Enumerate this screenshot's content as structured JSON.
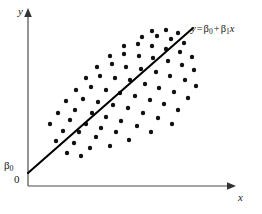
{
  "figure": {
    "kind": "scatter-with-regression-line",
    "background_color": "#ffffff",
    "axis_color": "#4d4d4d",
    "line_color": "#000000",
    "point_color": "#111111"
  },
  "labels": {
    "y_axis": "y",
    "x_axis": "x",
    "origin": "0",
    "intercept_symbol": "β",
    "intercept_subscript": "0",
    "equation": {
      "lhs": "y",
      "equals": "=",
      "beta0_symbol": "β",
      "beta0_sub": "0",
      "plus": "+",
      "beta1_symbol": "β",
      "beta1_sub": "1",
      "x_var": "x",
      "full_text": "y = β0 + β1x"
    }
  },
  "chart_data": {
    "type": "scatter",
    "title": "",
    "xlabel": "x",
    "ylabel": "y",
    "grid": false,
    "legend": null,
    "axis_ranges": {
      "x_pixel": [
        28,
        236
      ],
      "y_pixel": [
        10,
        186
      ]
    },
    "annotations": [
      {
        "name": "equation-label",
        "text": "y = β0 + β1x",
        "x": 191,
        "y": 29
      },
      {
        "name": "intercept-label",
        "text": "β0",
        "x": 10,
        "y": 166
      },
      {
        "name": "origin-label",
        "text": "0",
        "x": 17,
        "y": 180
      }
    ],
    "regression_line": {
      "name": "y = β0 + β1x",
      "x_start": 28,
      "y_start": 173,
      "x_end": 193,
      "y_end": 28,
      "intercept_label": "β0"
    },
    "point_radius": 2.2,
    "points": [
      [
        67,
        153
      ],
      [
        81,
        156
      ],
      [
        56,
        141
      ],
      [
        74,
        143
      ],
      [
        90,
        148
      ],
      [
        63,
        131
      ],
      [
        79,
        132
      ],
      [
        96,
        137
      ],
      [
        110,
        146
      ],
      [
        50,
        124
      ],
      [
        70,
        120
      ],
      [
        86,
        124
      ],
      [
        101,
        128
      ],
      [
        116,
        132
      ],
      [
        129,
        140
      ],
      [
        58,
        113
      ],
      [
        75,
        110
      ],
      [
        92,
        113
      ],
      [
        106,
        117
      ],
      [
        121,
        121
      ],
      [
        137,
        126
      ],
      [
        151,
        132
      ],
      [
        66,
        101
      ],
      [
        83,
        99
      ],
      [
        98,
        102
      ],
      [
        113,
        105
      ],
      [
        128,
        108
      ],
      [
        143,
        113
      ],
      [
        158,
        118
      ],
      [
        172,
        124
      ],
      [
        76,
        90
      ],
      [
        91,
        87
      ],
      [
        106,
        90
      ],
      [
        120,
        93
      ],
      [
        135,
        96
      ],
      [
        150,
        100
      ],
      [
        164,
        104
      ],
      [
        178,
        110
      ],
      [
        86,
        78
      ],
      [
        100,
        76
      ],
      [
        115,
        78
      ],
      [
        130,
        80
      ],
      [
        145,
        84
      ],
      [
        159,
        88
      ],
      [
        174,
        92
      ],
      [
        188,
        98
      ],
      [
        97,
        67
      ],
      [
        112,
        64
      ],
      [
        126,
        67
      ],
      [
        141,
        69
      ],
      [
        156,
        72
      ],
      [
        170,
        76
      ],
      [
        185,
        80
      ],
      [
        196,
        86
      ],
      [
        110,
        56
      ],
      [
        124,
        54
      ],
      [
        139,
        56
      ],
      [
        153,
        58
      ],
      [
        168,
        61
      ],
      [
        182,
        65
      ],
      [
        194,
        70
      ],
      [
        124,
        46
      ],
      [
        138,
        44
      ],
      [
        152,
        46
      ],
      [
        166,
        49
      ],
      [
        180,
        52
      ],
      [
        192,
        57
      ],
      [
        142,
        37
      ],
      [
        157,
        36
      ],
      [
        171,
        39
      ],
      [
        184,
        43
      ],
      [
        152,
        31
      ],
      [
        166,
        30
      ],
      [
        178,
        33
      ]
    ]
  }
}
